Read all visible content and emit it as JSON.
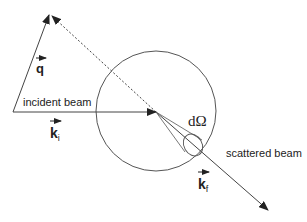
{
  "diagram": {
    "colors": {
      "line": "#333333",
      "background": "#ffffff"
    },
    "labels": {
      "incident_beam": "incident beam",
      "scattered_beam": "scattered beam",
      "solid_angle": "dΩ",
      "q_vector": "q",
      "ki_base": "k",
      "ki_sub": "i",
      "kf_base": "k",
      "kf_sub": "f"
    },
    "elements": {
      "sphere": {
        "cx": 156,
        "cy": 111,
        "r": 60
      },
      "incident_beam": {
        "from": [
          13,
          112
        ],
        "to": [
          156,
          112
        ]
      },
      "scattered_beam": {
        "from": [
          156,
          112
        ],
        "to": [
          268,
          210
        ]
      },
      "q_vector": {
        "from": [
          13,
          112
        ],
        "to": [
          50,
          14
        ]
      },
      "dashed_line": {
        "from": [
          156,
          112
        ],
        "to": [
          50,
          14
        ]
      },
      "detector_cone": {
        "apex": [
          156,
          112
        ],
        "ellipse": {
          "cx": 193,
          "cy": 145,
          "rx": 9,
          "ry": 12
        }
      }
    }
  }
}
